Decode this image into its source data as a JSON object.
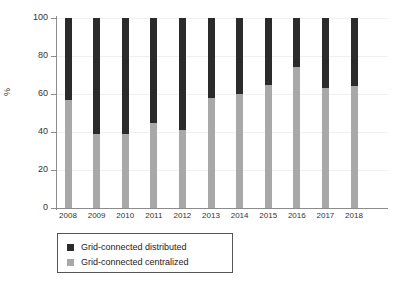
{
  "chart_data": {
    "type": "bar",
    "subtype": "stacked-100-percent",
    "title": "",
    "xlabel": "",
    "ylabel": "%",
    "ylim": [
      0,
      100
    ],
    "yticks": [
      0,
      20,
      40,
      60,
      80,
      100
    ],
    "grid": true,
    "legend_position": "bottom-left",
    "categories": [
      "2008",
      "2009",
      "2010",
      "2011",
      "2012",
      "2013",
      "2014",
      "2015",
      "2016",
      "2017",
      "2018"
    ],
    "series": [
      {
        "name": "Grid-connected centralized",
        "color": "#a8a8a8",
        "values": [
          57,
          39,
          39,
          45,
          41,
          58,
          60,
          65,
          74,
          63,
          64
        ]
      },
      {
        "name": "Grid-connected distributed",
        "color": "#2b2b2b",
        "values": [
          43,
          61,
          61,
          55,
          59,
          42,
          40,
          35,
          26,
          37,
          36
        ]
      }
    ]
  },
  "axis": {
    "y_title": "%",
    "y_tick_labels": [
      "0",
      "20",
      "40",
      "60",
      "80",
      "100"
    ],
    "x_tick_labels": [
      "2008",
      "2009",
      "2010",
      "2011",
      "2012",
      "2013",
      "2014",
      "2015",
      "2016",
      "2017",
      "2018"
    ]
  },
  "legend": {
    "entries": [
      {
        "label": "Grid-connected distributed",
        "color": "#2b2b2b"
      },
      {
        "label": "Grid-connected centralized",
        "color": "#a8a8a8"
      }
    ]
  }
}
